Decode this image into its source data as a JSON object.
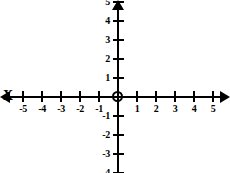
{
  "figure": {
    "kind": "cartesian-coordinate-plane",
    "title": "",
    "background_color": "#ffffff",
    "ink_color": "#000000",
    "width": 230,
    "height": 173
  },
  "geometry": {
    "origin_x": 118,
    "origin_y": 97,
    "unit_px": 19
  },
  "axes": {
    "x": {
      "name": "X",
      "min": -5,
      "max": 5,
      "arrow_start": true,
      "arrow_end": true,
      "ticks": [
        -5,
        -4,
        -3,
        -2,
        -1,
        1,
        2,
        3,
        4,
        5
      ],
      "tick_labels": [
        "-5",
        "-4",
        "-3",
        "-2",
        "-1",
        "1",
        "2",
        "3",
        "4",
        "5"
      ],
      "label_side": "below"
    },
    "y": {
      "name": "",
      "min": -4,
      "max": 5,
      "arrow_start": false,
      "arrow_end": true,
      "ticks": [
        5,
        4,
        3,
        2,
        1,
        -1,
        -2,
        -3,
        -4
      ],
      "tick_labels": [
        "5",
        "4",
        "3",
        "2",
        "1",
        "-1",
        "-2",
        "-3",
        "-4"
      ],
      "label_side": "left"
    }
  },
  "origin": {
    "marker": "open-circle",
    "label": "",
    "x": 0,
    "y": 0
  },
  "chart_data": {
    "type": "scatter",
    "title": "",
    "xlabel": "X",
    "ylabel": "",
    "xlim": [
      -5,
      5
    ],
    "ylim": [
      -4,
      5
    ],
    "grid": false,
    "legend": null,
    "series": [],
    "x": [],
    "y": [],
    "annotations": []
  }
}
